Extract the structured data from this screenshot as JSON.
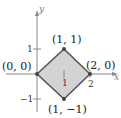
{
  "diagram": {
    "type": "coordinate-plane-region",
    "axes": {
      "x_label": "x",
      "y_label": "y",
      "x_ticks": [
        "1",
        "2"
      ],
      "y_ticks": [
        "1",
        "−1"
      ],
      "color": "#888888"
    },
    "region": {
      "fill": "#d3d3d3",
      "stroke": "#555555",
      "vertices": [
        {
          "label": "(0, 0)",
          "x": 0,
          "y": 0
        },
        {
          "label": "(1, 1)",
          "x": 1,
          "y": 1
        },
        {
          "label": "(2, 0)",
          "x": 2,
          "y": 0
        },
        {
          "label": "(1, −1)",
          "x": 1,
          "y": -1
        }
      ]
    }
  }
}
